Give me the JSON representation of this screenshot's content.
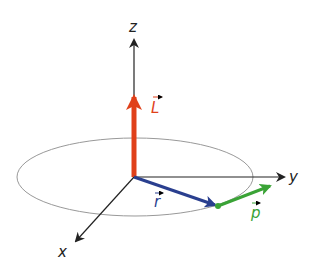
{
  "diagram": {
    "labels": {
      "z_axis": "z",
      "y_axis": "y",
      "x_axis": "x",
      "angular_momentum": "L",
      "position": "r",
      "momentum": "p"
    },
    "colors": {
      "axes": "#222222",
      "orbit": "#999999",
      "angular_momentum": "#e0401a",
      "position": "#2a3f8f",
      "momentum": "#3aa336"
    }
  }
}
